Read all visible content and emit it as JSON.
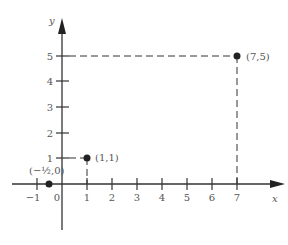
{
  "axes": {
    "x_label": "x",
    "y_label": "y",
    "x_ticks": [
      "−1",
      "0",
      "1",
      "2",
      "3",
      "4",
      "5",
      "6",
      "7"
    ],
    "y_ticks": [
      "1",
      "2",
      "3",
      "4",
      "5"
    ]
  },
  "points": [
    {
      "label": "(−½,0)",
      "x": -0.5,
      "y": 0
    },
    {
      "label": "(1,1)",
      "x": 1,
      "y": 1
    },
    {
      "label": "(7,5)",
      "x": 7,
      "y": 5
    }
  ],
  "colors": {
    "axis": "#333333",
    "point": "#333333",
    "text": "#555555"
  }
}
